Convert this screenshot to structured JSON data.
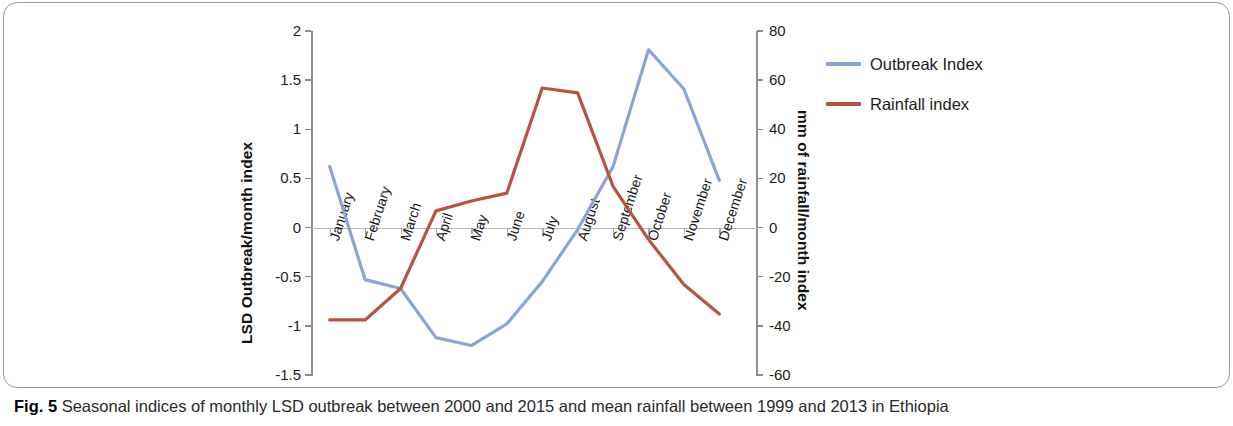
{
  "figure": {
    "caption_label": "Fig. 5",
    "caption_text": " Seasonal indices of monthly LSD outbreak between 2000 and 2015 and mean rainfall between 1999 and 2013 in Ethiopia"
  },
  "colors": {
    "outbreak_line": "#8CA5D8",
    "rainfall_line": "#B5553F",
    "axis": "#8d8d8d",
    "zero_axis": "#b9b9b9",
    "text": "#1c1c1c"
  },
  "legend": {
    "position": "right",
    "entries": [
      {
        "label": "Outbreak Index",
        "color": "#8CA5D8"
      },
      {
        "label": "Rainfall index",
        "color": "#B5553F"
      }
    ]
  },
  "chart_data": {
    "type": "line",
    "title": "",
    "subtitle": "",
    "xlabel": "",
    "ylabel": "LSD Outbreak/month index",
    "y2label": "mm of rainfall/month index",
    "grid": false,
    "legend_position": "right",
    "categories": [
      "January",
      "February",
      "March",
      "April",
      "May",
      "June",
      "July",
      "August",
      "September",
      "October",
      "November",
      "December"
    ],
    "ylim": [
      -1.5,
      2
    ],
    "yticks": [
      -1.5,
      -1,
      -0.5,
      0,
      0.5,
      1,
      1.5,
      2
    ],
    "ytick_labels": [
      "-1.5",
      "-1",
      "-0.5",
      "0",
      "0.5",
      "1",
      "1.5",
      "2"
    ],
    "y2lim": [
      -60,
      80
    ],
    "y2ticks": [
      -60,
      -40,
      -20,
      0,
      20,
      40,
      60,
      80
    ],
    "y2tick_labels": [
      "-60",
      "-40",
      "-20",
      "0",
      "20",
      "40",
      "60",
      "80"
    ],
    "series": [
      {
        "name": "Outbreak Index",
        "axis": "left",
        "color": "#8CA5D8",
        "values": [
          0.62,
          -0.53,
          -0.62,
          -1.12,
          -1.2,
          -0.98,
          -0.55,
          -0.02,
          0.62,
          1.81,
          1.41,
          0.48
        ]
      },
      {
        "name": "Rainfall index",
        "axis": "left",
        "color": "#B5553F",
        "values": [
          -0.94,
          -0.94,
          -0.62,
          0.17,
          0.27,
          0.35,
          1.42,
          1.37,
          0.42,
          -0.12,
          -0.58,
          -0.88
        ]
      }
    ]
  }
}
